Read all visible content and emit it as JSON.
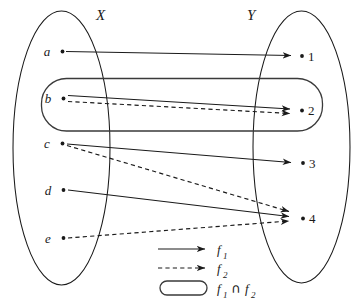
{
  "figure": {
    "domain_set": {
      "name": "X",
      "label": "X",
      "elements": [
        {
          "id": "a",
          "label": "a"
        },
        {
          "id": "b",
          "label": "b"
        },
        {
          "id": "c",
          "label": "c"
        },
        {
          "id": "d",
          "label": "d"
        },
        {
          "id": "e",
          "label": "e"
        }
      ]
    },
    "codomain_set": {
      "name": "Y",
      "label": "Y",
      "elements": [
        {
          "id": "1",
          "label": "1"
        },
        {
          "id": "2",
          "label": "2"
        },
        {
          "id": "3",
          "label": "3"
        },
        {
          "id": "4",
          "label": "4"
        }
      ]
    },
    "mappings": [
      {
        "from": "a",
        "to": "1",
        "function": "f1",
        "style": "solid"
      },
      {
        "from": "b",
        "to": "2",
        "function": "f1",
        "style": "solid"
      },
      {
        "from": "b",
        "to": "2",
        "function": "f2",
        "style": "dashed"
      },
      {
        "from": "c",
        "to": "3",
        "function": "f1",
        "style": "solid"
      },
      {
        "from": "c",
        "to": "4",
        "function": "f2",
        "style": "dashed"
      },
      {
        "from": "d",
        "to": "4",
        "function": "f1",
        "style": "solid"
      },
      {
        "from": "e",
        "to": "4",
        "function": "f2",
        "style": "dashed"
      }
    ],
    "legend": {
      "items": [
        {
          "key": "f1",
          "glyph": "solid-arrow-icon",
          "base": "f",
          "sub": "1"
        },
        {
          "key": "f2",
          "glyph": "dashed-arrow-icon",
          "base": "f",
          "sub": "2"
        },
        {
          "key": "f1_cap_f2",
          "glyph": "rounded-region-icon",
          "base": "f",
          "sub": "1",
          "operator": "∩",
          "base2": "f",
          "sub2": "2"
        }
      ]
    },
    "colors": {
      "ink": "#1a1a1a",
      "region_stroke": "#3a3a3a",
      "background": "#ffffff"
    }
  }
}
